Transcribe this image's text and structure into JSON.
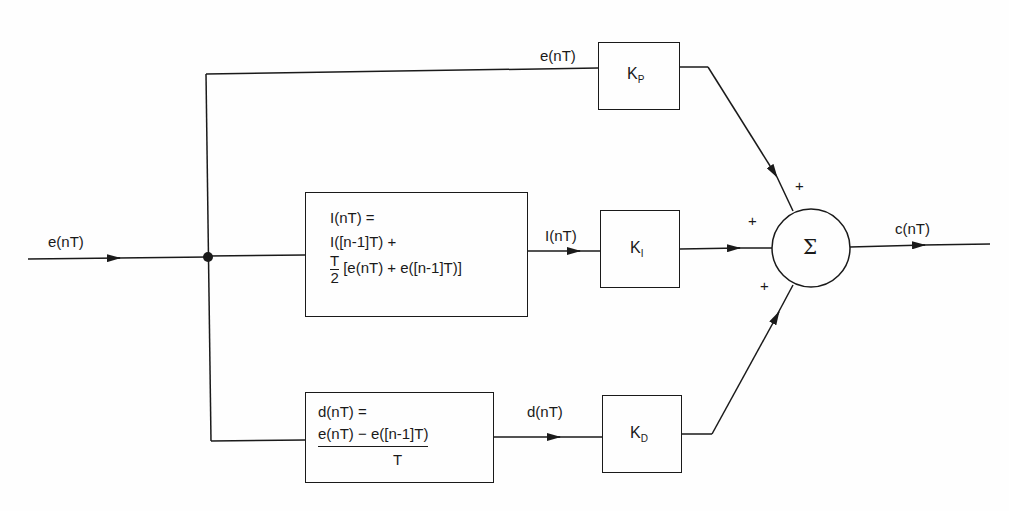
{
  "diagram": {
    "input": {
      "label": "e(nT)"
    },
    "output": {
      "label": "c(nT)"
    },
    "summer": {
      "symbol": "Σ",
      "signs": [
        "+",
        "+",
        "+"
      ]
    },
    "proportional": {
      "signal_label": "e(nT)",
      "gain_main": "K",
      "gain_sub": "P"
    },
    "integral": {
      "line1": "I(nT) =",
      "line2": "I([n-1]T) +",
      "frac_num": "T",
      "frac_den": "2",
      "line3_rest": "[e(nT) + e([n-1]T)]",
      "signal_label": "I(nT)",
      "gain_main": "K",
      "gain_sub": "I"
    },
    "derivative": {
      "line1": "d(nT) =",
      "numerator": "e(nT) − e([n-1]T)",
      "denominator": "T",
      "signal_label": "d(nT)",
      "gain_main": "K",
      "gain_sub": "D"
    }
  }
}
